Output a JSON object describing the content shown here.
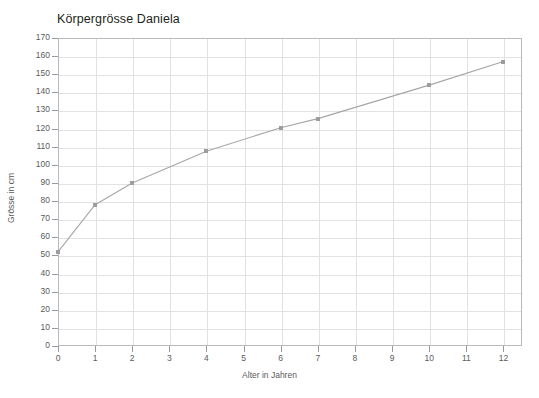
{
  "chart_data": {
    "type": "line",
    "title": "Körpergrösse Daniela",
    "xlabel": "Alter in Jahren",
    "ylabel": "Grösse in cm",
    "x": [
      0,
      1,
      2,
      4,
      6,
      7,
      10,
      12
    ],
    "values": [
      52,
      78,
      90,
      107.5,
      120.5,
      125.5,
      144,
      157
    ],
    "series": [
      {
        "name": "Körpergrösse Daniela",
        "x": [
          0,
          1,
          2,
          4,
          6,
          7,
          10,
          12
        ],
        "values": [
          52,
          78,
          90,
          107.5,
          120.5,
          125.5,
          144,
          157
        ]
      }
    ],
    "xlim": [
      0,
      12.5
    ],
    "ylim": [
      0,
      170
    ],
    "xticks": [
      0,
      1,
      2,
      3,
      4,
      5,
      6,
      7,
      8,
      9,
      10,
      11,
      12
    ],
    "yticks": [
      0,
      10,
      20,
      30,
      40,
      50,
      60,
      70,
      80,
      90,
      100,
      110,
      120,
      130,
      140,
      150,
      160,
      170
    ],
    "xtick_labels": [
      "0",
      "1",
      "2",
      "3",
      "4",
      "5",
      "6",
      "7",
      "8",
      "9",
      "10",
      "11",
      "12"
    ],
    "ytick_labels": [
      "0",
      "10",
      "20",
      "30",
      "40",
      "50",
      "60",
      "70",
      "80",
      "90",
      "100",
      "110",
      "120",
      "130",
      "140",
      "150",
      "160",
      "170"
    ],
    "grid": true,
    "legend": false,
    "legend_position": "none",
    "marker": "square",
    "line_color": "#a6a6a9",
    "marker_color": "#9d9da0",
    "grid_color": "#e2e2e4",
    "axis_color": "#b9b9bb",
    "title_color": "#231f20",
    "tick_label_color": "#5b5b5d",
    "background_color": "#ffffff"
  }
}
